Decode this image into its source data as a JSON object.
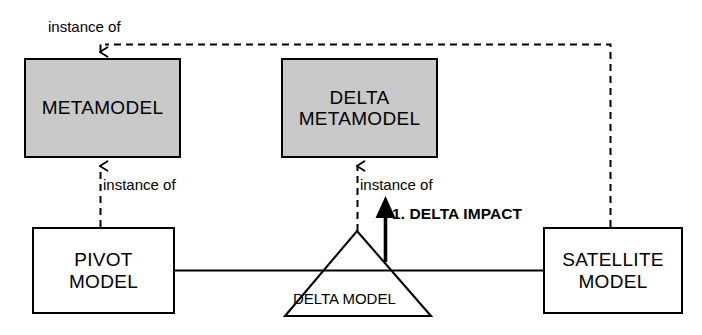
{
  "diagram": {
    "colors": {
      "metamodel_fill": "#c9c9c9",
      "model_fill": "#ffffff",
      "stroke": "#000000",
      "background": "#ffffff"
    },
    "nodes": [
      {
        "id": "metamodel",
        "label": "METAMODEL",
        "kind": "metamodel",
        "shape": "rectangle",
        "x": 24,
        "y": 58,
        "w": 157,
        "h": 100
      },
      {
        "id": "delta-metamodel",
        "label": "DELTA\nMETAMODEL",
        "kind": "metamodel",
        "shape": "rectangle",
        "x": 281,
        "y": 58,
        "w": 157,
        "h": 100
      },
      {
        "id": "pivot-model",
        "label": "PIVOT\nMODEL",
        "kind": "model",
        "shape": "rectangle",
        "x": 32,
        "y": 227,
        "w": 143,
        "h": 87
      },
      {
        "id": "satellite-model",
        "label": "SATELLITE\nMODEL",
        "kind": "model",
        "shape": "rectangle",
        "x": 543,
        "y": 227,
        "w": 140,
        "h": 87
      },
      {
        "id": "delta-model",
        "label": "DELTA MODEL",
        "kind": "model",
        "shape": "triangle",
        "apex_x": 357,
        "apex_y": 231,
        "base_left_x": 285,
        "base_right_x": 431,
        "base_y": 316
      }
    ],
    "edges": [
      {
        "id": "pivot-instance-of-metamodel",
        "label": "instance of",
        "style": "dashed",
        "arrow": "open",
        "from": "pivot-model",
        "to": "metamodel"
      },
      {
        "id": "delta-instance-of-delta-metamodel",
        "label": "instance of",
        "style": "dashed",
        "arrow": "open",
        "from": "delta-model",
        "to": "delta-metamodel"
      },
      {
        "id": "satellite-instance-of-metamodel",
        "label": "instance of",
        "style": "dashed",
        "arrow": "open",
        "from": "satellite-model",
        "to": "metamodel"
      },
      {
        "id": "pivot-to-delta",
        "label": "",
        "style": "solid",
        "arrow": "none",
        "from": "pivot-model",
        "to": "delta-model"
      },
      {
        "id": "delta-to-satellite",
        "label": "",
        "style": "solid",
        "arrow": "none",
        "from": "delta-model",
        "to": "satellite-model"
      },
      {
        "id": "delta-impact",
        "label": "1. DELTA IMPACT",
        "style": "solid-thick",
        "arrow": "filled",
        "from": "delta-model",
        "to": "delta-metamodel"
      }
    ],
    "labels": {
      "instance_of_top": "instance of",
      "instance_of_left": "instance of",
      "instance_of_middle": "instance of",
      "delta_impact": "1. DELTA IMPACT",
      "delta_model": "DELTA MODEL"
    }
  }
}
